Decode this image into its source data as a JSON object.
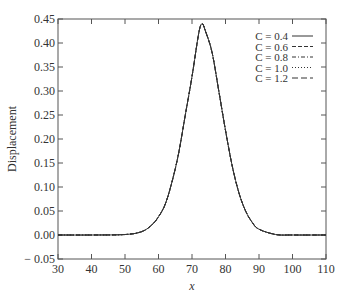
{
  "chart_data": {
    "type": "line",
    "title": "",
    "xlabel": "x",
    "ylabel": "Displacement",
    "xlim": [
      30,
      110
    ],
    "ylim": [
      -0.05,
      0.45
    ],
    "xticks": [
      30,
      40,
      50,
      60,
      70,
      80,
      90,
      100,
      110
    ],
    "xtick_labels": [
      "30",
      "40",
      "50",
      "60",
      "70",
      "80",
      "90",
      "100",
      "110"
    ],
    "yticks": [
      -0.05,
      0.0,
      0.05,
      0.1,
      0.15,
      0.2,
      0.25,
      0.3,
      0.35,
      0.4,
      0.45
    ],
    "ytick_labels": [
      "− 0.05",
      "0.00",
      "0.05",
      "0.10",
      "0.15",
      "0.20",
      "0.25",
      "0.30",
      "0.35",
      "0.40",
      "0.45"
    ],
    "grid": false,
    "legend_position": "top-right",
    "series": [
      {
        "name": "C = 0.4",
        "style": "solid",
        "x": [
          30,
          40,
          50,
          55,
          58,
          60,
          62,
          64,
          66,
          68,
          70,
          72,
          73,
          74,
          76,
          78,
          80,
          82,
          84,
          86,
          88,
          90,
          95,
          100,
          110
        ],
        "y": [
          0.0,
          0.0,
          0.001,
          0.007,
          0.021,
          0.038,
          0.064,
          0.11,
          0.17,
          0.25,
          0.33,
          0.42,
          0.44,
          0.425,
          0.38,
          0.3,
          0.218,
          0.144,
          0.088,
          0.05,
          0.026,
          0.012,
          0.001,
          0.0,
          0.0
        ]
      },
      {
        "name": "C = 0.6",
        "style": "dash",
        "x": [
          30,
          40,
          50,
          55,
          58,
          60,
          62,
          64,
          66,
          68,
          70,
          72,
          73,
          74,
          76,
          78,
          80,
          82,
          84,
          86,
          88,
          90,
          95,
          100,
          110
        ],
        "y": [
          0.0,
          0.0,
          0.001,
          0.007,
          0.021,
          0.038,
          0.064,
          0.11,
          0.17,
          0.25,
          0.33,
          0.42,
          0.44,
          0.425,
          0.38,
          0.3,
          0.218,
          0.144,
          0.088,
          0.05,
          0.026,
          0.012,
          0.001,
          0.0,
          0.0
        ]
      },
      {
        "name": "C = 0.8",
        "style": "dashdot",
        "x": [
          30,
          40,
          50,
          55,
          58,
          60,
          62,
          64,
          66,
          68,
          70,
          72,
          73,
          74,
          76,
          78,
          80,
          82,
          84,
          86,
          88,
          90,
          95,
          100,
          110
        ],
        "y": [
          0.0,
          0.0,
          0.001,
          0.007,
          0.021,
          0.038,
          0.064,
          0.11,
          0.17,
          0.25,
          0.33,
          0.42,
          0.44,
          0.425,
          0.38,
          0.3,
          0.218,
          0.144,
          0.088,
          0.05,
          0.026,
          0.012,
          0.001,
          0.0,
          0.0
        ]
      },
      {
        "name": "C = 1.0",
        "style": "dot",
        "x": [
          30,
          40,
          50,
          55,
          58,
          60,
          62,
          64,
          66,
          68,
          70,
          72,
          73,
          74,
          76,
          78,
          80,
          82,
          84,
          86,
          88,
          90,
          95,
          100,
          110
        ],
        "y": [
          0.0,
          0.0,
          0.001,
          0.007,
          0.021,
          0.038,
          0.064,
          0.11,
          0.17,
          0.25,
          0.33,
          0.42,
          0.44,
          0.425,
          0.38,
          0.3,
          0.218,
          0.144,
          0.088,
          0.05,
          0.026,
          0.012,
          0.001,
          0.0,
          0.0
        ]
      },
      {
        "name": "C = 1.2",
        "style": "longdash",
        "x": [
          30,
          40,
          50,
          55,
          58,
          60,
          62,
          64,
          66,
          68,
          70,
          72,
          73,
          74,
          76,
          78,
          80,
          82,
          84,
          86,
          88,
          90,
          95,
          100,
          110
        ],
        "y": [
          0.0,
          0.0,
          0.001,
          0.007,
          0.021,
          0.038,
          0.064,
          0.11,
          0.17,
          0.25,
          0.33,
          0.42,
          0.44,
          0.425,
          0.38,
          0.3,
          0.218,
          0.144,
          0.088,
          0.05,
          0.026,
          0.012,
          0.001,
          0.0,
          0.0
        ]
      }
    ],
    "line_color": "#333333"
  }
}
